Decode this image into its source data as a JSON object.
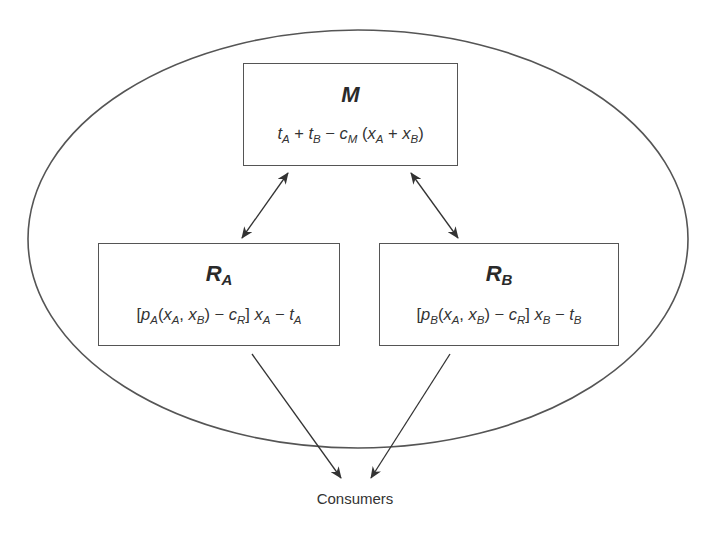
{
  "diagram": {
    "boundary": {
      "shape": "ellipse",
      "stroke": "#555555"
    },
    "nodes": {
      "manufacturer": {
        "title": "M",
        "formula_parts": [
          "t",
          "A",
          " + ",
          "t",
          "B",
          " − ",
          "c",
          "M",
          " (",
          "x",
          "A",
          " + ",
          "x",
          "B",
          ")"
        ]
      },
      "retailer_a": {
        "title": "R",
        "title_sub": "A",
        "formula_parts": [
          "[",
          "p",
          "A",
          "(",
          "x",
          "A",
          ", ",
          "x",
          "B",
          ") − ",
          "c",
          "R",
          "] ",
          "x",
          "A",
          " − ",
          "t",
          "A"
        ]
      },
      "retailer_b": {
        "title": "R",
        "title_sub": "B",
        "formula_parts": [
          "[",
          "p",
          "B",
          "(",
          "x",
          "A",
          ", ",
          "x",
          "B",
          ") − ",
          "c",
          "R",
          "] ",
          "x",
          "B",
          " − ",
          "t",
          "B"
        ]
      }
    },
    "outside_node": {
      "label": "Consumers"
    },
    "edges": [
      {
        "from": "manufacturer",
        "to": "retailer_a",
        "type": "bidirectional"
      },
      {
        "from": "manufacturer",
        "to": "retailer_b",
        "type": "bidirectional"
      },
      {
        "from": "retailer_a",
        "to": "consumers",
        "type": "directed"
      },
      {
        "from": "retailer_b",
        "to": "consumers",
        "type": "directed"
      }
    ]
  }
}
